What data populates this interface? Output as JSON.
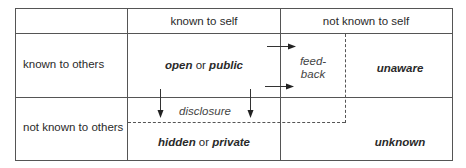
{
  "diagram": {
    "type": "johari-window",
    "columns": {
      "col1_header": "known to self",
      "col2_header": "not known to self"
    },
    "rows": {
      "row1_label": "known to others",
      "row2_label": "not known to others"
    },
    "quadrants": {
      "open": {
        "bold": "open",
        "connector": " or ",
        "bold2": "public"
      },
      "unaware": "unaware",
      "hidden": {
        "bold": "hidden",
        "connector": " or ",
        "bold2": "private"
      },
      "unknown": "unknown"
    },
    "annotations": {
      "feedback_line1": "feed-",
      "feedback_line2": "back",
      "disclosure": "disclosure"
    },
    "colors": {
      "line": "#555555",
      "text": "#2a2a2a"
    }
  }
}
